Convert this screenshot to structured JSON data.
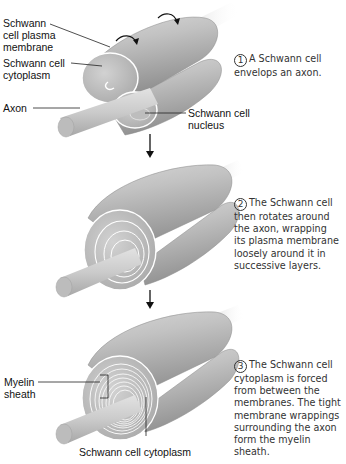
{
  "figure": {
    "colors": {
      "cell_fill": "#b9b9b9",
      "cell_highlight": "#e4e4e4",
      "axon_fill": "#cdcdcd",
      "membrane_line": "#ffffff",
      "text": "#111111",
      "step_text": "#333333"
    }
  },
  "stage1": {
    "labels": {
      "plasma_membrane": "Schwann cell plasma membrane",
      "plasma_membrane_l1": "Schwann",
      "plasma_membrane_l2": "cell plasma",
      "plasma_membrane_l3": "membrane",
      "cytoplasm_l1": "Schwann cell",
      "cytoplasm_l2": "cytoplasm",
      "axon": "Axon",
      "nucleus_l1": "Schwann cell",
      "nucleus_l2": "nucleus"
    },
    "step": {
      "number": "1",
      "line1": "A Schwann cell",
      "line2": "envelops an axon."
    }
  },
  "stage2": {
    "step": {
      "number": "2",
      "line1": "The Schwann cell",
      "line2": "then rotates around",
      "line3": "the axon, wrapping",
      "line4": "its plasma membrane",
      "line5": "loosely around it in",
      "line6": "successive layers."
    }
  },
  "stage3": {
    "labels": {
      "myelin_l1": "Myelin",
      "myelin_l2": "sheath",
      "cytoplasm": "Schwann cell cytoplasm"
    },
    "step": {
      "number": "3",
      "line1": "The Schwann cell",
      "line2": "cytoplasm is forced",
      "line3": "from between the",
      "line4": "membranes. The tight",
      "line5": "membrane wrappings",
      "line6": "surrounding the axon",
      "line7": "form the myelin",
      "line8": "sheath."
    }
  },
  "arrows": [
    {
      "from": "stage1",
      "to": "stage2"
    },
    {
      "from": "stage2",
      "to": "stage3"
    }
  ]
}
